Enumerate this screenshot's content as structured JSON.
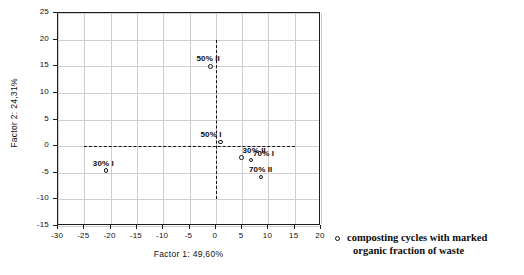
{
  "chart_data": {
    "type": "scatter",
    "title": "",
    "xlabel": "Factor 1: 49,60%",
    "ylabel": "Factor 2: 24,31%",
    "xlim": [
      -30,
      20
    ],
    "ylim": [
      -15,
      25
    ],
    "xticks": [
      -30,
      -25,
      -20,
      -15,
      -10,
      -5,
      0,
      5,
      10,
      15,
      20
    ],
    "xticklabels": [
      "-30",
      "-25",
      "-20",
      "-15",
      "-10",
      "-5",
      "0",
      "5",
      "10",
      "15",
      "20"
    ],
    "yticks": [
      -15,
      -10,
      -5,
      0,
      5,
      10,
      15,
      20,
      25
    ],
    "yticklabels": [
      "-15",
      "-10",
      "-5",
      "0",
      "5",
      "10",
      "15",
      "20",
      "25"
    ],
    "grid": true,
    "legend_position": "right-outside",
    "reference_lines": [
      {
        "axis": "vertical",
        "value": 0,
        "from": -10,
        "to": 20,
        "style": "dashed"
      },
      {
        "axis": "horizontal",
        "value": 0,
        "from": -25,
        "to": 15,
        "style": "dashed"
      }
    ],
    "marker": "open-circle",
    "points": [
      {
        "label": "50% II",
        "x": -1.0,
        "y": 15.0,
        "label_dx": -14,
        "label_dy": -12
      },
      {
        "label": "50% I",
        "x": 0.9,
        "y": 0.8,
        "label_dx": -20,
        "label_dy": -12
      },
      {
        "label": "30% II",
        "x": 4.9,
        "y": -2.1,
        "label_dx": 1,
        "label_dy": -11
      },
      {
        "label": "70% I",
        "x": 6.7,
        "y": -2.6,
        "label_dx": 2,
        "label_dy": -11
      },
      {
        "label": "70% II",
        "x": 8.6,
        "y": -5.8,
        "label_dx": -12,
        "label_dy": -12
      },
      {
        "label": "30% I",
        "x": -20.9,
        "y": -4.6,
        "label_dx": -13,
        "label_dy": -12
      }
    ]
  },
  "legend": {
    "marker": "open-circle-marker",
    "line1": "composting cycles with marked",
    "line2": "organic fraction of waste"
  }
}
